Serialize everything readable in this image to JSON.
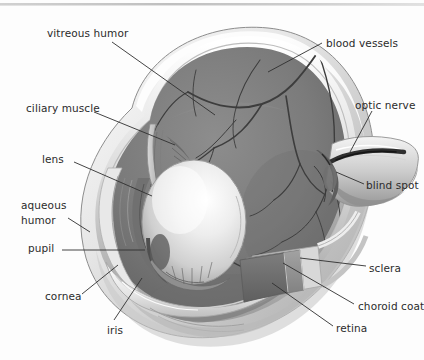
{
  "figure": {
    "background": "#fdfdfd",
    "ink": "#2b2b2b"
  },
  "palette": {
    "vitreous_fill": "#7c7c7c",
    "vitreous_dark": "#6a6a6a",
    "sclera_outer": "#efefef",
    "sclera_shadow": "#bdbdbd",
    "choroid": "#8e8e8e",
    "retina": "#707070",
    "lens_light": "#f2f2f2",
    "lens_mid": "#cfcfcf",
    "vessel": "#3a3a3a",
    "outline": "#4a4a4a"
  },
  "labels": [
    {
      "id": "vitreous-humor",
      "text": "vitreous humor",
      "x": 47,
      "y": 27,
      "align": "left"
    },
    {
      "id": "ciliary-muscle",
      "text": "ciliary muscle",
      "x": 26,
      "y": 102,
      "align": "left"
    },
    {
      "id": "lens",
      "text": "lens",
      "x": 42,
      "y": 153,
      "align": "left"
    },
    {
      "id": "aqueous",
      "text": "aqueous",
      "x": 21,
      "y": 199,
      "align": "left"
    },
    {
      "id": "humor",
      "text": "humor",
      "x": 21,
      "y": 214,
      "align": "left"
    },
    {
      "id": "pupil",
      "text": "pupil",
      "x": 28,
      "y": 242,
      "align": "left"
    },
    {
      "id": "cornea",
      "text": "cornea",
      "x": 45,
      "y": 290,
      "align": "left"
    },
    {
      "id": "iris",
      "text": "iris",
      "x": 107,
      "y": 324,
      "align": "left"
    },
    {
      "id": "blood-vessels",
      "text": "blood vessels",
      "x": 326,
      "y": 37,
      "align": "left"
    },
    {
      "id": "optic-nerve",
      "text": "optic nerve",
      "x": 355,
      "y": 99,
      "align": "left"
    },
    {
      "id": "blind-spot",
      "text": "blind spot",
      "x": 366,
      "y": 179,
      "align": "left"
    },
    {
      "id": "sclera",
      "text": "sclera",
      "x": 369,
      "y": 262,
      "align": "left"
    },
    {
      "id": "choroid-coat",
      "text": "choroid coat",
      "x": 358,
      "y": 300,
      "align": "left"
    },
    {
      "id": "retina",
      "text": "retina",
      "x": 336,
      "y": 322,
      "align": "left"
    }
  ],
  "leaders": [
    {
      "id": "leader-vitreous-humor",
      "points": "112,42 215,115"
    },
    {
      "id": "leader-ciliary-muscle",
      "points": "94,112 175,145"
    },
    {
      "id": "leader-lens",
      "points": "74,162 152,196"
    },
    {
      "id": "leader-aqueous-humor",
      "points": "68,218 90,232"
    },
    {
      "id": "leader-pupil",
      "points": "62,250 145,250"
    },
    {
      "id": "leader-cornea",
      "points": "82,294 118,265"
    },
    {
      "id": "leader-iris",
      "points": "114,320 142,278"
    },
    {
      "id": "leader-blood-vessels",
      "points": "322,43 268,72"
    },
    {
      "id": "leader-optic-nerve",
      "points": "372,111 350,152"
    },
    {
      "id": "leader-blind-spot",
      "points": "364,184 336,172"
    },
    {
      "id": "leader-sclera",
      "points": "366,266 300,258"
    },
    {
      "id": "leader-choroid-coat",
      "points": "354,304 283,263"
    },
    {
      "id": "leader-retina",
      "points": "333,326 272,283"
    }
  ],
  "parts": [
    {
      "id": "sclera-shell",
      "name": "sclera (white outer coat)"
    },
    {
      "id": "choroid-layer",
      "name": "choroid coat"
    },
    {
      "id": "retina-layer",
      "name": "retina"
    },
    {
      "id": "vitreous-body",
      "name": "vitreous humor chamber"
    },
    {
      "id": "lens-body",
      "name": "lens"
    },
    {
      "id": "iris-body",
      "name": "iris"
    },
    {
      "id": "cornea-dome",
      "name": "cornea"
    },
    {
      "id": "pupil-opening",
      "name": "pupil"
    },
    {
      "id": "ciliary-body",
      "name": "ciliary muscle"
    },
    {
      "id": "optic-nerve-trunk",
      "name": "optic nerve"
    },
    {
      "id": "blind-spot-disc",
      "name": "blind spot / optic disc"
    },
    {
      "id": "vessel-tree",
      "name": "retinal blood vessels"
    }
  ]
}
